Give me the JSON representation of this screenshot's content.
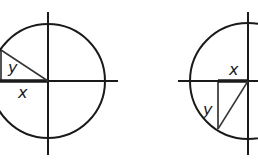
{
  "diagram": {
    "left": {
      "labels": {
        "y": "y",
        "x": "x"
      },
      "quadrant": "II"
    },
    "right": {
      "labels": {
        "x": "x",
        "y": "y"
      },
      "quadrant": "III"
    },
    "colors": {
      "stroke": "#1a1a1a",
      "background": "#ffffff"
    }
  }
}
